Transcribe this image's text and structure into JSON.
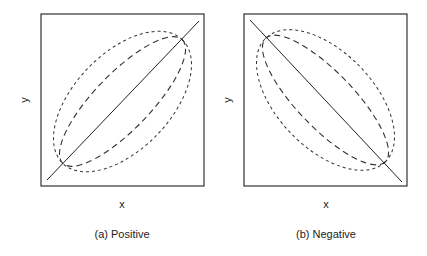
{
  "figure": {
    "panels": [
      {
        "id": "a",
        "caption": "(a) Positive",
        "xlabel": "x",
        "ylabel": "y",
        "correlation": "positive",
        "frame": {
          "x": 41,
          "y": 14,
          "w": 163,
          "h": 172
        },
        "line": {
          "x1": 47,
          "y1": 180,
          "x2": 199,
          "y2": 21
        },
        "center": {
          "x": 122.5,
          "y": 101.5
        },
        "rotation_deg": -46,
        "outer_ellipse": {
          "rx": 86,
          "ry": 48,
          "dash": "3,3"
        },
        "inner_ellipse": {
          "rx": 86,
          "ry": 28,
          "dash": "6,4"
        }
      },
      {
        "id": "b",
        "caption": "(b) Negative",
        "xlabel": "x",
        "ylabel": "y",
        "correlation": "negative",
        "frame": {
          "x": 244,
          "y": 14,
          "w": 163,
          "h": 172
        },
        "line": {
          "x1": 250,
          "y1": 20,
          "x2": 402,
          "y2": 182
        },
        "center": {
          "x": 325.5,
          "y": 100
        },
        "rotation_deg": 46,
        "outer_ellipse": {
          "rx": 86,
          "ry": 48,
          "dash": "3,3"
        },
        "inner_ellipse": {
          "rx": 86,
          "ry": 28,
          "dash": "6,4"
        }
      }
    ],
    "colors": {
      "stroke": "#222222",
      "background": "#ffffff"
    }
  }
}
